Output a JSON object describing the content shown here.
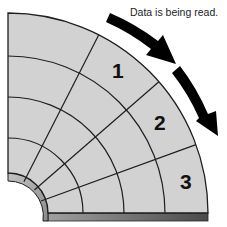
{
  "caption": "Data is being read.",
  "disk": {
    "description": "Quarter section of a disk platter divided into tracks and sectors",
    "face_color": "#d2d2d2",
    "line_color": "#1e1e1e",
    "edge_gradient": [
      "#9a9a9a",
      "#4a4a4a"
    ]
  },
  "sectors": [
    {
      "label": "1"
    },
    {
      "label": "2"
    },
    {
      "label": "3"
    }
  ],
  "arrows": {
    "color": "#000000",
    "direction": "clockwise",
    "count": 2
  }
}
